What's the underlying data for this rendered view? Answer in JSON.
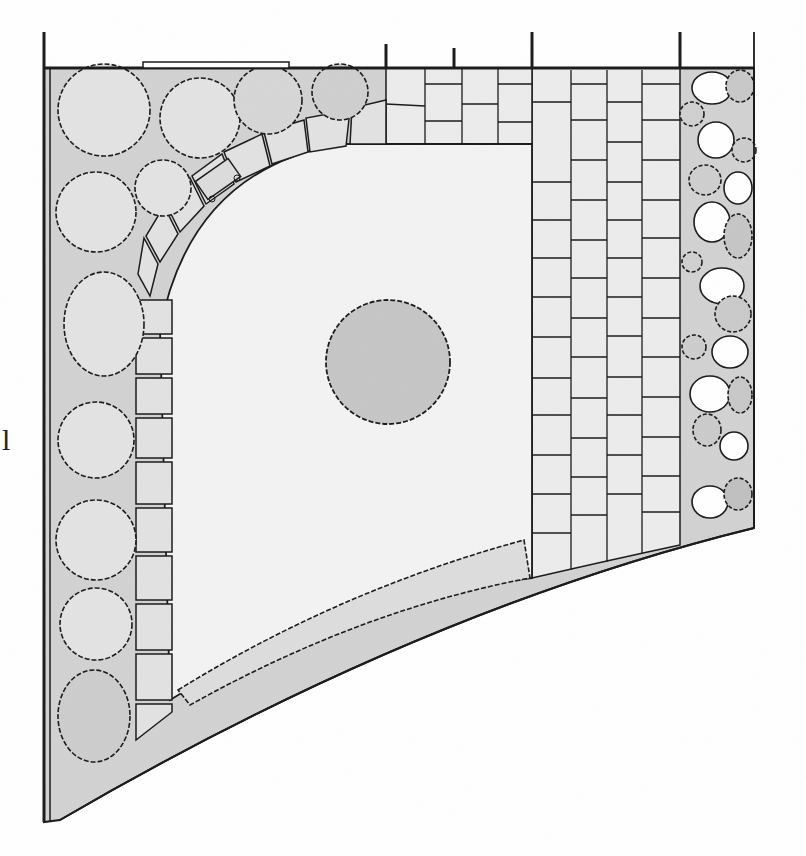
{
  "drawing": {
    "type": "hand-drawn garden plan (top view)",
    "style": "pencil sketch, grayscale",
    "colors": {
      "paper": "#ffffff",
      "ink": "#1a1a1a",
      "planting_bed": "#cfcfcf",
      "lawn": "#f1f1f1",
      "paving": "#e9e9e9",
      "tree_fill": "#c4c4c4",
      "shrub_dark": "#bdbdbd"
    }
  },
  "edge_text_fragments": [
    {
      "text": "l",
      "x": 2,
      "y": 425
    }
  ],
  "zones": {
    "left_bed": {
      "label": "shrub border",
      "shrub_count": 13
    },
    "curved_path": {
      "label": "curved stepping-stone path",
      "stone_count": 16,
      "has_bench": true
    },
    "lawn": {
      "label": "lawn"
    },
    "center_tree": {
      "label": "specimen tree",
      "cx": 388,
      "cy": 362,
      "r": 62
    },
    "lower_hedge": {
      "label": "low hedge along curved boundary"
    },
    "top_paving": {
      "label": "paved terrace strip"
    },
    "right_paving": {
      "label": "paving slab path",
      "columns": 4
    },
    "right_bed": {
      "label": "mixed planting bed with boulders"
    }
  },
  "boundary": {
    "top_fence_y": 68,
    "posts_x": [
      44,
      386,
      454,
      532,
      680,
      754
    ],
    "gate_x": [
      143,
      289
    ]
  }
}
